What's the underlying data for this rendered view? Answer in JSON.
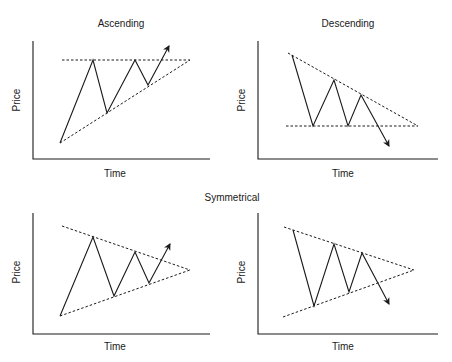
{
  "figure": {
    "center_label": "Symmetrical",
    "panels": [
      {
        "id": "ascending",
        "title": "Ascending",
        "xlabel": "Time",
        "ylabel": "Price",
        "axis": {
          "x0": 33,
          "ytop": 41,
          "ybottom": 159,
          "xright": 210
        },
        "title_pos": [
          121,
          27
        ],
        "xlabel_pos": [
          115,
          177
        ],
        "ylabel_pos": [
          20,
          100
        ],
        "dashed_lines": [
          [
            [
              62,
              60
            ],
            [
              190,
              60
            ]
          ],
          [
            [
              60,
              143
            ],
            [
              190,
              60
            ]
          ]
        ],
        "zigzag": [
          [
            60,
            143
          ],
          [
            93,
            60
          ],
          [
            107,
            113
          ],
          [
            135,
            60
          ],
          [
            148,
            85
          ],
          [
            169,
            46
          ]
        ]
      },
      {
        "id": "descending",
        "title": "Descending",
        "xlabel": "Time",
        "ylabel": "Price",
        "axis": {
          "x0": 258,
          "ytop": 41,
          "ybottom": 159,
          "xright": 438
        },
        "title_pos": [
          348,
          27
        ],
        "xlabel_pos": [
          343,
          177
        ],
        "ylabel_pos": [
          245,
          100
        ],
        "dashed_lines": [
          [
            [
              288,
              53
            ],
            [
              418,
              126
            ]
          ],
          [
            [
              286,
              126
            ],
            [
              418,
              126
            ]
          ]
        ],
        "zigzag": [
          [
            292,
            55
          ],
          [
            313,
            126
          ],
          [
            334,
            80
          ],
          [
            348,
            126
          ],
          [
            361,
            95
          ],
          [
            389,
            146
          ]
        ]
      },
      {
        "id": "symmetrical-up",
        "title": "",
        "xlabel": "Time",
        "ylabel": "Price",
        "axis": {
          "x0": 33,
          "ytop": 213,
          "ybottom": 334,
          "xright": 210
        },
        "title_pos": [
          0,
          0
        ],
        "xlabel_pos": [
          115,
          350
        ],
        "ylabel_pos": [
          20,
          272
        ],
        "dashed_lines": [
          [
            [
              62,
              226
            ],
            [
              190,
              270
            ]
          ],
          [
            [
              60,
              316
            ],
            [
              190,
              270
            ]
          ]
        ],
        "zigzag": [
          [
            60,
            316
          ],
          [
            93,
            237
          ],
          [
            114,
            296
          ],
          [
            135,
            252
          ],
          [
            149,
            283
          ],
          [
            170,
            244
          ]
        ]
      },
      {
        "id": "symmetrical-down",
        "title": "",
        "xlabel": "Time",
        "ylabel": "Price",
        "axis": {
          "x0": 258,
          "ytop": 213,
          "ybottom": 334,
          "xright": 438
        },
        "title_pos": [
          0,
          0
        ],
        "xlabel_pos": [
          343,
          350
        ],
        "ylabel_pos": [
          245,
          272
        ],
        "dashed_lines": [
          [
            [
              284,
              227
            ],
            [
              414,
              270
            ]
          ],
          [
            [
              283,
              317
            ],
            [
              414,
              270
            ]
          ]
        ],
        "zigzag": [
          [
            293,
            230
          ],
          [
            314,
            306
          ],
          [
            334,
            244
          ],
          [
            349,
            292
          ],
          [
            362,
            253
          ],
          [
            389,
            304
          ]
        ]
      }
    ],
    "center_label_pos": [
      232,
      201
    ],
    "line_color": "#1a1a1a"
  }
}
